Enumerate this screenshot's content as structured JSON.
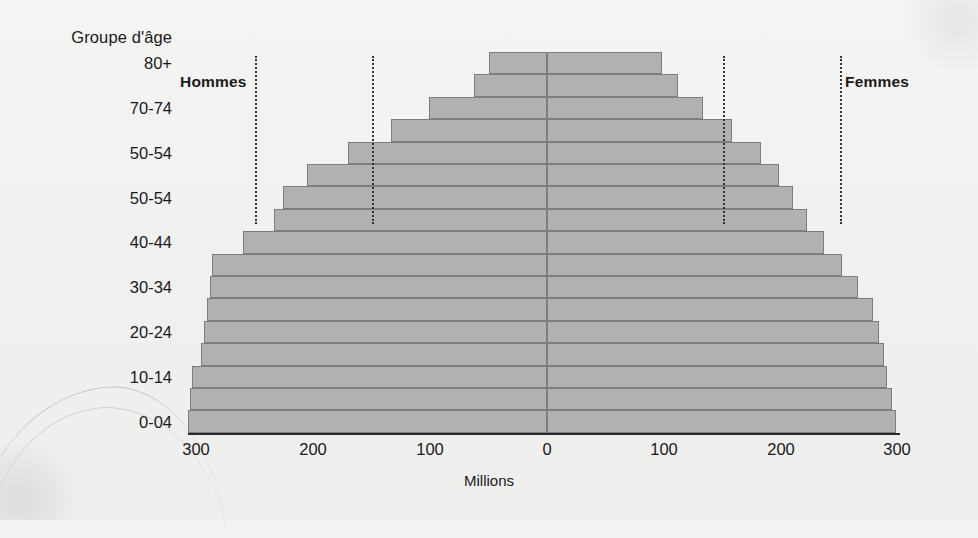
{
  "chart_data": {
    "type": "bar",
    "subtype": "population-pyramid",
    "title": "",
    "xlabel": "Millions",
    "ylabel": "Groupe d'âge",
    "grid": false,
    "legend_position": "inline-top",
    "xlim": [
      -300,
      300
    ],
    "x_ticks": [
      300,
      200,
      100,
      0,
      100,
      200,
      300
    ],
    "x_tick_px": [
      196,
      313,
      430,
      547,
      664,
      781,
      897
    ],
    "units": "Millions",
    "axis_zero_px": 547,
    "px_per_100m": 117,
    "series": [
      {
        "name": "Hommes",
        "side": "left"
      },
      {
        "name": "Femmes",
        "side": "right"
      }
    ],
    "guide_lines": [
      250,
      150,
      150,
      250
    ],
    "categories_shown": [
      "80+",
      "70-74",
      "50-54",
      "50-54",
      "40-44",
      "30-34",
      "20-24",
      "10-14",
      "0-04"
    ],
    "rows": [
      {
        "index": 0,
        "label": "80+",
        "hommes": 50,
        "femmes": 98
      },
      {
        "index": 1,
        "label": "",
        "hommes": 62,
        "femmes": 112
      },
      {
        "index": 2,
        "label": "70-74",
        "hommes": 101,
        "femmes": 133
      },
      {
        "index": 3,
        "label": "",
        "hommes": 133,
        "femmes": 158
      },
      {
        "index": 4,
        "label": "50-54",
        "hommes": 170,
        "femmes": 183
      },
      {
        "index": 5,
        "label": "",
        "hommes": 205,
        "femmes": 198
      },
      {
        "index": 6,
        "label": "50-54",
        "hommes": 226,
        "femmes": 210
      },
      {
        "index": 7,
        "label": "",
        "hommes": 233,
        "femmes": 222
      },
      {
        "index": 8,
        "label": "40-44",
        "hommes": 260,
        "femmes": 237
      },
      {
        "index": 9,
        "label": "",
        "hommes": 286,
        "femmes": 252
      },
      {
        "index": 10,
        "label": "30-34",
        "hommes": 288,
        "femmes": 266
      },
      {
        "index": 11,
        "label": "",
        "hommes": 291,
        "femmes": 279
      },
      {
        "index": 12,
        "label": "20-24",
        "hommes": 293,
        "femmes": 284
      },
      {
        "index": 13,
        "label": "",
        "hommes": 296,
        "femmes": 288
      },
      {
        "index": 14,
        "label": "10-14",
        "hommes": 303,
        "femmes": 291
      },
      {
        "index": 15,
        "label": "",
        "hommes": 305,
        "femmes": 295
      },
      {
        "index": 16,
        "label": "0-04",
        "hommes": 307,
        "femmes": 298
      }
    ]
  },
  "labels": {
    "y_axis_title": "Groupe d'âge",
    "x_axis_title": "Millions",
    "left_series": "Hommes",
    "right_series": "Femmes"
  },
  "x_ticks": [
    {
      "text": "300",
      "px": 196
    },
    {
      "text": "200",
      "px": 313
    },
    {
      "text": "100",
      "px": 430
    },
    {
      "text": "0",
      "px": 547
    },
    {
      "text": "100",
      "px": 664
    },
    {
      "text": "200",
      "px": 781
    },
    {
      "text": "300",
      "px": 897
    }
  ],
  "colors": {
    "background": "#f2f2f0",
    "bar_fill": "#b1b1b1",
    "bar_stroke": "#7d7d7d",
    "axis": "#2b2b2b",
    "text": "#1a1a1a",
    "guide": "#333333"
  }
}
